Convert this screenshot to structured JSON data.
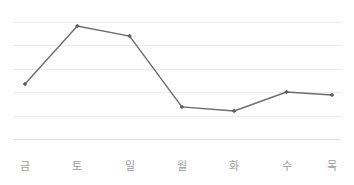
{
  "chart_data": {
    "type": "line",
    "title": "",
    "subtitle": "",
    "xlabel": "",
    "ylabel": "",
    "categories": [
      "금",
      "토",
      "일",
      "월",
      "화",
      "수",
      "목"
    ],
    "category_meanings": [
      "Fri",
      "Sat",
      "Sun",
      "Mon",
      "Tue",
      "Wed",
      "Thu"
    ],
    "values": [
      2.35,
      4.83,
      4.4,
      1.37,
      1.2,
      2.01,
      1.88
    ],
    "series": [
      {
        "name": "",
        "values": [
          2.35,
          4.83,
          4.4,
          1.37,
          1.2,
          2.01,
          1.88
        ]
      }
    ],
    "ylim": [
      0,
      5
    ],
    "y_gridline_values": [
      0,
      1,
      2,
      3,
      4,
      5
    ],
    "y_tick_labels": [],
    "grid": true,
    "grid_axis": "y",
    "legend": false,
    "legend_position": "none",
    "markers": true,
    "marker_shape": "diamond",
    "annotations": []
  },
  "style": {
    "background_color": "#ffffff",
    "line_color": "#6d6d6d",
    "marker_color": "#5f5f5f",
    "gridline_color": "#ececec",
    "axis_line_color": "#e2e2e2",
    "label_color": "#9b9b9b"
  },
  "geometry": {
    "plot_left": 13,
    "plot_right": 341,
    "grid_top_y": 22,
    "grid_bottom_y": 139,
    "grid_step_y": 23.4,
    "point_x": [
      25,
      77.3,
      129.6,
      181.9,
      234.2,
      286.5,
      332
    ],
    "point_y": [
      84,
      26,
      36,
      107,
      111,
      92,
      95
    ],
    "label_y": 160
  }
}
